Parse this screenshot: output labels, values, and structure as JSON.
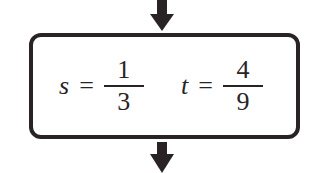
{
  "diagram": {
    "type": "flowchart-step",
    "arrows": {
      "top": "down-arrow-in",
      "bottom": "down-arrow-out"
    },
    "box": {
      "expressions": [
        {
          "variable": "s",
          "operator": "=",
          "numerator": "1",
          "denominator": "3"
        },
        {
          "variable": "t",
          "operator": "=",
          "numerator": "4",
          "denominator": "9"
        }
      ]
    },
    "colors": {
      "stroke": "#2a2326",
      "background": "#ffffff"
    }
  }
}
